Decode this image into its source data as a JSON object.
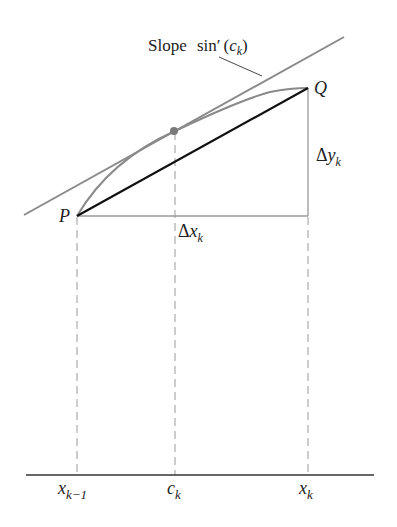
{
  "diagram": {
    "tangent_label": {
      "prefix": "Slope",
      "func": "sin′",
      "open": "(",
      "var": "c",
      "sub": "k",
      "close": ")"
    },
    "points": {
      "P": "P",
      "Q": "Q"
    },
    "delta_y": {
      "symbol": "Δ",
      "var": "y",
      "sub": "k"
    },
    "delta_x": {
      "symbol": "Δ",
      "var": "x",
      "sub": "k"
    },
    "axis_labels": [
      {
        "var": "x",
        "sub": "k−1"
      },
      {
        "var": "c",
        "sub": "k"
      },
      {
        "var": "x",
        "sub": "k"
      }
    ],
    "colors": {
      "curve": "#8a8a8a",
      "tangent": "#8a8a8a",
      "secant": "#111111",
      "legs": "#9a9a9a",
      "dashed": "#9a9a9a",
      "axis": "#333333",
      "point": "#7a7a7a"
    }
  }
}
